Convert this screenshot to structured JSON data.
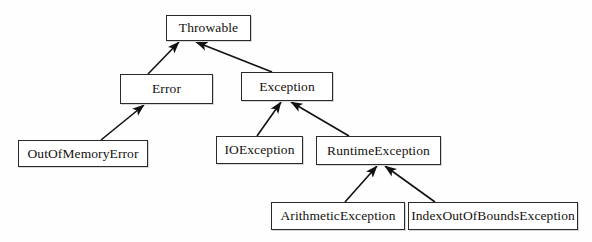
{
  "diagram": {
    "style": {
      "background_color": "#fefefe",
      "box_fill_color": "#ffffff",
      "box_border_color": "#2a2a2a",
      "text_color": "#15120f",
      "edge_color": "#111111"
    },
    "nodes": [
      {
        "id": "throwable",
        "label": "Throwable",
        "x": 166,
        "y": 15,
        "width": 85,
        "height": 26
      },
      {
        "id": "error",
        "label": "Error",
        "x": 120,
        "y": 74,
        "width": 93,
        "height": 30
      },
      {
        "id": "exception",
        "label": "Exception",
        "x": 241,
        "y": 72,
        "width": 92,
        "height": 29
      },
      {
        "id": "outofmemoryerror",
        "label": "OutOfMemoryError",
        "x": 18,
        "y": 140,
        "width": 130,
        "height": 27
      },
      {
        "id": "ioexception",
        "label": "IOException",
        "x": 216,
        "y": 136,
        "width": 87,
        "height": 28
      },
      {
        "id": "runtimeexception",
        "label": "RuntimeException",
        "x": 316,
        "y": 136,
        "width": 125,
        "height": 29
      },
      {
        "id": "arithmeticexception",
        "label": "ArithmeticException",
        "x": 271,
        "y": 202,
        "width": 134,
        "height": 28
      },
      {
        "id": "indexoutofboundsexception",
        "label": "IndexOutOfBoundsException",
        "x": 408,
        "y": 202,
        "width": 170,
        "height": 28
      }
    ],
    "edges": [
      {
        "id": "error-to-throwable",
        "from": "error",
        "to": "throwable",
        "relation": "extends",
        "arrowhead": "to",
        "x1": 148,
        "y1": 74,
        "x2": 179,
        "y2": 42
      },
      {
        "id": "exception-to-throwable",
        "from": "exception",
        "to": "throwable",
        "relation": "extends",
        "arrowhead": "to",
        "x1": 272,
        "y1": 72,
        "x2": 196,
        "y2": 42
      },
      {
        "id": "outofmemoryerror-to-error",
        "from": "outofmemoryerror",
        "to": "error",
        "relation": "extends",
        "arrowhead": "to",
        "x1": 101,
        "y1": 140,
        "x2": 144,
        "y2": 105
      },
      {
        "id": "ioexception-to-exception",
        "from": "ioexception",
        "to": "exception",
        "relation": "extends",
        "arrowhead": "to",
        "x1": 257,
        "y1": 136,
        "x2": 281,
        "y2": 102
      },
      {
        "id": "runtimeexception-to-exception",
        "from": "runtimeexception",
        "to": "exception",
        "relation": "extends",
        "arrowhead": "to",
        "x1": 349,
        "y1": 136,
        "x2": 291,
        "y2": 102
      },
      {
        "id": "arithmeticexception-to-runtimeexception",
        "from": "arithmeticexception",
        "to": "runtimeexception",
        "relation": "extends",
        "arrowhead": "to",
        "x1": 345,
        "y1": 202,
        "x2": 377,
        "y2": 166
      },
      {
        "id": "indexoutofboundsexception-to-runtimeexception",
        "from": "indexoutofboundsexception",
        "to": "runtimeexception",
        "relation": "extends",
        "arrowhead": "to",
        "x1": 435,
        "y1": 202,
        "x2": 385,
        "y2": 166
      }
    ]
  }
}
